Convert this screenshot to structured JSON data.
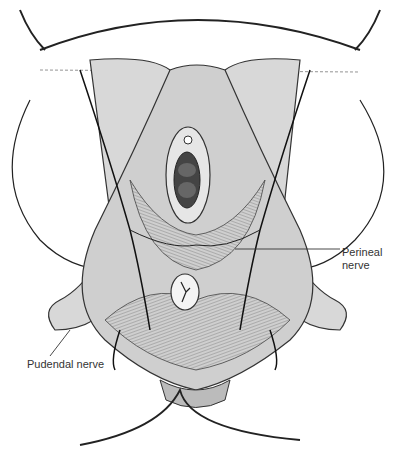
{
  "figure": {
    "labels": [
      {
        "id": "perineal",
        "line1": "Perineal",
        "line2": "nerve"
      },
      {
        "id": "pudendal",
        "text": "Pudendal nerve"
      }
    ]
  }
}
